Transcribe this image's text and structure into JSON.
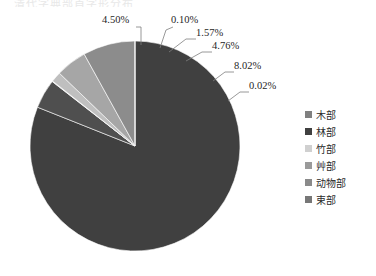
{
  "top_strip": {
    "text": "清代字典部首字形分布"
  },
  "chart_data": {
    "type": "pie",
    "title": "",
    "subtitle": "",
    "xlabel": "",
    "ylabel": "",
    "legend_position": "right",
    "grid": false,
    "categories": [
      "木部",
      "林部",
      "竹部",
      "艸部",
      "动物部",
      "束部"
    ],
    "values": [
      81.03,
      4.5,
      0.1,
      1.57,
      4.76,
      8.02
    ],
    "extra_value": 0.02,
    "slices": [
      {
        "label": "木部",
        "value": 81.03,
        "display": "",
        "color": "#404040",
        "labeled": false
      },
      {
        "label": "林部",
        "value": 4.5,
        "display": "4.50%",
        "color": "#4f4f4f",
        "labeled": true
      },
      {
        "label": "竹部",
        "value": 0.1,
        "display": "0.10%",
        "color": "#d9d9d9",
        "labeled": true
      },
      {
        "label": "艸部",
        "value": 1.57,
        "display": "1.57%",
        "color": "#bfbfbf",
        "labeled": true
      },
      {
        "label": "动物部",
        "value": 4.76,
        "display": "4.76%",
        "color": "#a6a6a6",
        "labeled": true
      },
      {
        "label": "束部",
        "value": 8.02,
        "display": "8.02%",
        "color": "#8c8c8c",
        "labeled": true
      },
      {
        "label": "",
        "value": 0.02,
        "display": "0.02%",
        "color": "#595959",
        "labeled": true
      }
    ],
    "labels": [
      {
        "text": "4.50%"
      },
      {
        "text": "0.10%"
      },
      {
        "text": "1.57%"
      },
      {
        "text": "4.76%"
      },
      {
        "text": "8.02%"
      },
      {
        "text": "0.02%"
      }
    ],
    "legend": [
      {
        "label": "木部",
        "color": "#808080"
      },
      {
        "label": "林部",
        "color": "#404040"
      },
      {
        "label": "竹部",
        "color": "#d0d0d0"
      },
      {
        "label": "艸部",
        "color": "#9a9a9a"
      },
      {
        "label": "动物部",
        "color": "#8a8a8a"
      },
      {
        "label": "束部",
        "color": "#777777"
      }
    ]
  },
  "colors": {
    "background": "#ffffff",
    "text": "#262626",
    "leader_line": "#7f7f7f"
  }
}
